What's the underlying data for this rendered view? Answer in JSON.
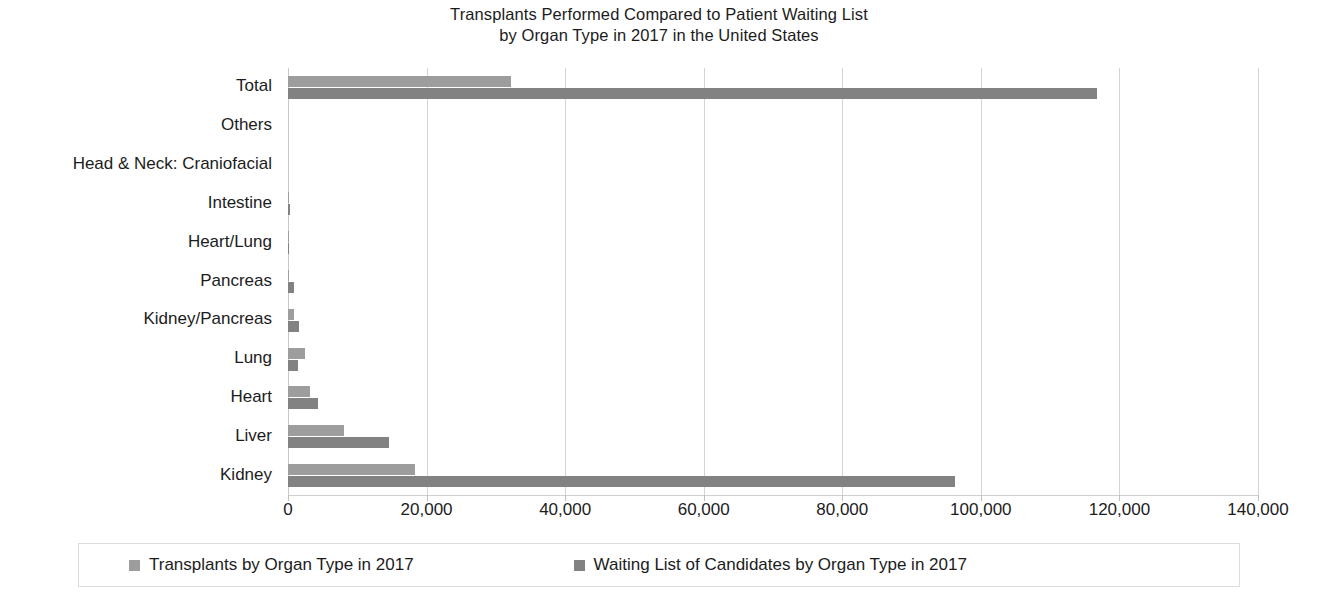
{
  "chart_data": {
    "type": "bar",
    "orientation": "horizontal",
    "title": "Transplants Performed Compared to Patient Waiting List by Organ Type in 2017 in the United States",
    "title_lines": [
      "Transplants Performed Compared to Patient Waiting List",
      "by Organ Type in 2017 in the United States"
    ],
    "xlabel": "",
    "ylabel": "",
    "xlim": [
      0,
      140000
    ],
    "xticks": [
      0,
      20000,
      40000,
      60000,
      80000,
      100000,
      120000,
      140000
    ],
    "xtick_labels": [
      "0",
      "20,000",
      "40,000",
      "60,000",
      "80,000",
      "100,000",
      "120,000",
      "140,000"
    ],
    "grid": "vertical",
    "legend_position": "bottom",
    "categories": [
      "Total",
      "Others",
      "Head & Neck: Craniofacial",
      "Intestine",
      "Heart/Lung",
      "Pancreas",
      "Kidney/Pancreas",
      "Lung",
      "Heart",
      "Liver",
      "Kidney"
    ],
    "series": [
      {
        "name": "Transplants by Organ Type in 2017",
        "color": "#9d9d9d",
        "values": [
          32230,
          0,
          2,
          109,
          31,
          192,
          835,
          2449,
          3190,
          8082,
          18300
        ]
      },
      {
        "name": "Waiting List of Candidates by Organ Type in 2017",
        "color": "#828282",
        "values": [
          116750,
          0,
          0,
          275,
          44,
          923,
          1600,
          1465,
          4330,
          14570,
          96250
        ]
      }
    ]
  },
  "legend": {
    "items": [
      {
        "label": "Transplants by Organ Type in 2017",
        "swatch": "#9d9d9d"
      },
      {
        "label": "Waiting List of Candidates by Organ Type in 2017",
        "swatch": "#828282"
      }
    ]
  }
}
